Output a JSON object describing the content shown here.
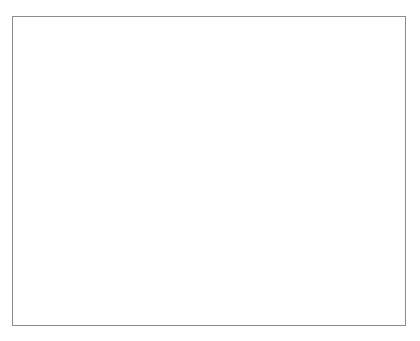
{
  "figure": {
    "background": "#ffffff",
    "frame_color": "#8c8c8c"
  },
  "chart_data": {
    "type": "line",
    "title": "",
    "xlabel": "Year",
    "ylabel": "Growth Rate of Real GDP (%)",
    "xlim": [
      1999.0,
      2002.15
    ],
    "ylim": [
      -0.03,
      0.06
    ],
    "xticks": [
      1999,
      2000,
      2001,
      2002
    ],
    "xticklabels": [
      "1999",
      "2000",
      "2001",
      "2002"
    ],
    "yticks": [
      -0.03,
      -0.02,
      -0.01,
      0,
      0.01,
      0.02,
      0.03,
      0.04,
      0.05,
      0.06
    ],
    "yticklabels": [
      "-0.03",
      "-0.02",
      "-0.01",
      "0",
      "0.01",
      "0.02",
      "0.03",
      "0.04",
      "0.05",
      "0.06"
    ],
    "grid": false,
    "zero_line": true,
    "legend_position": "inline-annotations",
    "x": [
      1999.0,
      1999.25,
      1999.5,
      1999.75,
      2000.0,
      2000.25,
      2000.5,
      2000.75,
      2001.0,
      2001.25,
      2001.5,
      2001.75,
      2002.0,
      2002.15
    ],
    "series": [
      {
        "name": "Canada",
        "color": "#6e6e6e",
        "values": [
          0.046,
          0.051,
          0.0545,
          0.0565,
          0.0565,
          0.0545,
          0.0525,
          0.0475,
          0.0355,
          0.0275,
          0.0205,
          0.0145,
          0.0125,
          0.0165
        ]
      },
      {
        "name": "United States",
        "color": "#121212",
        "values": [
          0.041,
          0.0405,
          0.0398,
          0.0405,
          0.0408,
          0.049,
          0.0408,
          0.0455,
          0.0305,
          0.0155,
          0.0018,
          -0.0015,
          -0.0005,
          0.0155
        ]
      },
      {
        "name": "Germany",
        "color": "#3f3f3f",
        "values": [
          0.0108,
          0.0108,
          0.0175,
          0.0245,
          0.0298,
          0.0305,
          0.0318,
          0.0295,
          0.0252,
          0.0165,
          0.0075,
          0.0038,
          0.0052,
          0.0125
        ]
      },
      {
        "name": "United Kingdom",
        "color": "#b6b6b6",
        "values": [
          0.0212,
          0.0198,
          0.0195,
          0.0232,
          0.0292,
          0.0308,
          0.0322,
          0.0305,
          0.0278,
          0.0235,
          0.0195,
          0.017,
          0.0175,
          0.0212
        ]
      },
      {
        "name": "Japan",
        "color": "#dcdcdc",
        "values": [
          -0.013,
          -0.0005,
          0.0108,
          0.0215,
          0.0298,
          0.0308,
          0.0092,
          0.0255,
          0.0255,
          0.0065,
          -0.0058,
          -0.0162,
          -0.0145,
          -0.0118
        ]
      }
    ],
    "annotations": [
      {
        "label": "Canada",
        "x": 1999.62,
        "y": 0.057,
        "leader_to_x": 1999.52,
        "leader_to_y": 0.0428
      },
      {
        "label": "United States",
        "x": 2000.05,
        "y": 0.0512,
        "leader_to_x": 1999.92,
        "leader_to_y": 0.0358
      },
      {
        "label": "Germany",
        "x": 2000.62,
        "y": 0.0428,
        "leader_to_x": 2000.53,
        "leader_to_y": 0.0268
      },
      {
        "label": "United Kingdom",
        "x": 2001.12,
        "y": 0.0345,
        "leader_to_x": 2001.04,
        "leader_to_y": 0.0162
      },
      {
        "label": "Japan",
        "x": 2000.87,
        "y": -0.0188,
        "leader_to_x": 2000.78,
        "leader_to_y": -0.0058
      }
    ]
  }
}
